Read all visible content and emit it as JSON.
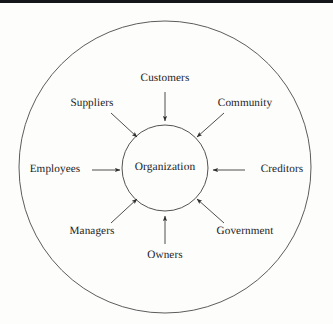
{
  "diagram": {
    "type": "hub-and-spoke stakeholder circle",
    "center": {
      "label": "Organization",
      "cx": 165,
      "cy": 168,
      "r": 43
    },
    "outer_ring": {
      "cx": 165,
      "cy": 167,
      "r": 146
    },
    "colors": {
      "background": "#fdfdfc",
      "stroke": "#3a3a3a",
      "text": "#1b1b1b",
      "scan_edge": "#15161a"
    },
    "stakeholders": [
      {
        "label": "Customers",
        "position": "top",
        "label_x": 165,
        "label_y": 79,
        "arrow": {
          "x1": 165,
          "y1": 92,
          "x2": 165,
          "y2": 121,
          "direction": "down"
        }
      },
      {
        "label": "Suppliers",
        "position": "top-left",
        "label_x": 92,
        "label_y": 104,
        "arrow": {
          "x1": 111,
          "y1": 113,
          "x2": 137,
          "y2": 137,
          "direction": "down-right"
        }
      },
      {
        "label": "Community",
        "position": "top-right",
        "label_x": 245,
        "label_y": 104,
        "arrow": {
          "x1": 224,
          "y1": 113,
          "x2": 197,
          "y2": 137,
          "direction": "down-left"
        }
      },
      {
        "label": "Employees",
        "position": "left",
        "label_x": 55,
        "label_y": 170,
        "arrow": {
          "x1": 92,
          "y1": 170,
          "x2": 120,
          "y2": 170,
          "direction": "right"
        }
      },
      {
        "label": "Creditors",
        "position": "right",
        "label_x": 282,
        "label_y": 170,
        "arrow": {
          "x1": 245,
          "y1": 170,
          "x2": 213,
          "y2": 170,
          "direction": "left"
        }
      },
      {
        "label": "Managers",
        "position": "bottom-left",
        "label_x": 92,
        "label_y": 232,
        "arrow": {
          "x1": 111,
          "y1": 223,
          "x2": 137,
          "y2": 199,
          "direction": "up-right"
        }
      },
      {
        "label": "Government",
        "position": "bottom-right",
        "label_x": 245,
        "label_y": 232,
        "arrow": {
          "x1": 224,
          "y1": 223,
          "x2": 197,
          "y2": 199,
          "direction": "up-left"
        }
      },
      {
        "label": "Owners",
        "position": "bottom",
        "label_x": 165,
        "label_y": 256,
        "arrow": {
          "x1": 165,
          "y1": 244,
          "x2": 165,
          "y2": 216,
          "direction": "up"
        }
      }
    ]
  }
}
